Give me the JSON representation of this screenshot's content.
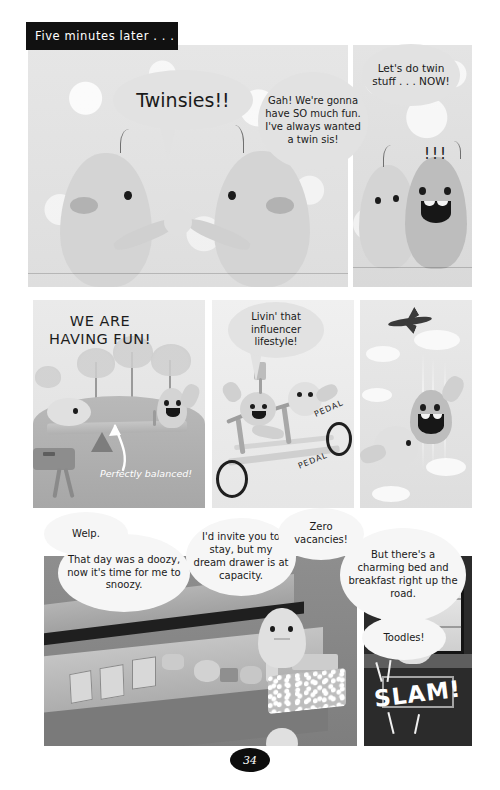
{
  "page": {
    "number": "34",
    "caption": "Five minutes later . . ."
  },
  "panels": {
    "p1": {
      "name": "twins-high-five-panel",
      "bubbles": [
        {
          "id": "twinsies",
          "text": "Twinsies!!"
        }
      ]
    },
    "p2": {
      "name": "gah-excited-panel",
      "bubbles": [
        {
          "id": "gah",
          "text": "Gah! We're gonna have SO much fun. I've always wanted a twin sis!"
        }
      ]
    },
    "p3": {
      "name": "twin-stuff-now-panel",
      "bubbles": [
        {
          "id": "twinstuff",
          "text": "Let's do twin stuff . . . NOW!"
        }
      ],
      "effects": [
        {
          "id": "excite-marks",
          "text": "!!!"
        }
      ]
    },
    "p4": {
      "name": "seesaw-panel",
      "art_text": [
        {
          "id": "we-are-having-fun",
          "text": "WE ARE HAVING FUN!"
        },
        {
          "id": "perfectly-balanced",
          "text": "Perfectly balanced!"
        }
      ]
    },
    "p5": {
      "name": "tandem-bike-panel",
      "bubbles": [
        {
          "id": "influencer",
          "text": "Livin' that influencer lifestyle!"
        }
      ],
      "art_text": [
        {
          "id": "pedal-upper",
          "text": "PEDAL"
        },
        {
          "id": "pedal-lower",
          "text": "PEDAL"
        }
      ]
    },
    "p6": {
      "name": "skydiving-panel",
      "art_text": []
    },
    "p7": {
      "name": "dresser-bedroom-panel",
      "bubbles": [
        {
          "id": "welp",
          "text": "Welp."
        },
        {
          "id": "doozy",
          "text": "That day was a doozy, now it's time for me to snoozy."
        },
        {
          "id": "invite",
          "text": "I'd invite you to stay, but my dream drawer is at capacity."
        },
        {
          "id": "zero-vacancies",
          "text": "Zero vacancies!"
        }
      ]
    },
    "p8": {
      "name": "slam-door-panel",
      "bubbles": [
        {
          "id": "bnb",
          "text": "But there's a charming bed and breakfast right up the road."
        },
        {
          "id": "toodles",
          "text": "Toodles!"
        }
      ],
      "art_text": [
        {
          "id": "slam",
          "text": "SLAM!"
        }
      ]
    }
  },
  "colors": {
    "caption_bg": "#111111",
    "caption_fg": "#ffffff",
    "bubble_bg": "#ebebeb",
    "ink": "#1a1a1a",
    "page_bg": "#ffffff",
    "pagenum_bg": "#0d0d0d"
  }
}
